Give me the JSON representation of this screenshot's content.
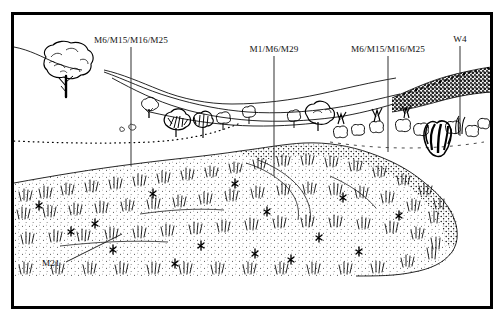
{
  "figure": {
    "type": "landscape-profile-drawing",
    "style": "pen-and-ink line drawing",
    "frame": {
      "border_color": "#000000",
      "background_color": "#ffffff",
      "x": 12,
      "y": 13,
      "width": 480,
      "height": 295
    }
  },
  "annotations": [
    {
      "id": "label-m6-m15-m16-m25-left",
      "text": "M6/M15/M16/M25",
      "text_x": 131,
      "text_y": 43,
      "anchor": "middle",
      "leader": {
        "type": "vertical-line",
        "x": 131,
        "y1": 47,
        "y2": 166
      }
    },
    {
      "id": "label-m1-m6-m29",
      "text": "M1/M6/M29",
      "text_x": 274,
      "text_y": 52,
      "anchor": "middle",
      "leader": {
        "type": "vertical-line",
        "x": 274,
        "y1": 56,
        "y2": 176
      }
    },
    {
      "id": "label-m6-m15-m16-m25-right",
      "text": "M6/M15/M16/M25",
      "text_x": 388,
      "text_y": 52,
      "anchor": "middle",
      "leader": {
        "type": "vertical-line",
        "x": 388,
        "y1": 56,
        "y2": 152
      }
    },
    {
      "id": "label-w4",
      "text": "W4",
      "text_x": 460,
      "text_y": 42,
      "anchor": "middle",
      "leader": {
        "type": "vertical-line",
        "x": 460,
        "y1": 46,
        "y2": 136
      }
    },
    {
      "id": "label-m21",
      "text": "M21",
      "text_x": 42,
      "text_y": 266,
      "anchor": "start",
      "leader": {
        "type": "diagonal-line",
        "x1": 66,
        "y1": 262,
        "x2": 122,
        "y2": 234
      }
    }
  ],
  "colors": {
    "ink": "#000000",
    "paper": "#ffffff",
    "label_text": "#111111"
  }
}
